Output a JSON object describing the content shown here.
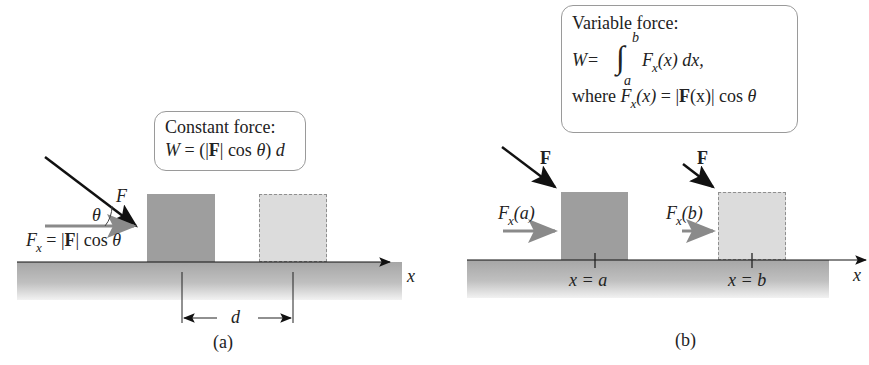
{
  "panel_a": {
    "caption": "(a)",
    "box": {
      "title": "Constant force:",
      "eq_W": "W",
      "eq_eq": " = (",
      "eq_bar1": "|",
      "eq_F": "F",
      "eq_bar2": "|",
      "eq_cos": " cos ",
      "eq_theta": "θ",
      "eq_close": ") ",
      "eq_d": "d"
    },
    "force_label": "F",
    "angle_label": "θ",
    "fx_F": "F",
    "fx_sub": "x",
    "fx_rest": " = |",
    "fx_bold": "F",
    "fx_tail": "| cos ",
    "fx_theta": "θ",
    "distance_label": "d",
    "axis_label": "x",
    "colors": {
      "block_solid": "#9e9e9e",
      "block_dashed": "#dcdcdc",
      "arrow_gray": "#8a8a8a",
      "arrow_black": "#111111"
    }
  },
  "panel_b": {
    "caption": "(b)",
    "box": {
      "title": "Variable force:",
      "eq_W": "W",
      "eq_eq": " =",
      "int_upper": "b",
      "int_lower": "a",
      "int_sign": "∫",
      "int_F": "F",
      "int_sub": "x",
      "int_rest": "(x) dx,",
      "where": "where ",
      "where_F": "F",
      "where_sub": "x",
      "where_x": "(x)",
      "where_eq": " = |",
      "where_bold": "F",
      "where_tail": "(x)| cos ",
      "where_theta": "θ"
    },
    "force_label_1": "F",
    "force_label_2": "F",
    "fxa_F": "F",
    "fxa_sub": "x",
    "fxa_arg": "(a)",
    "fxb_F": "F",
    "fxb_sub": "x",
    "fxb_arg": "(b)",
    "pos_a": "x = a",
    "pos_b": "x = b",
    "axis_label": "x"
  }
}
